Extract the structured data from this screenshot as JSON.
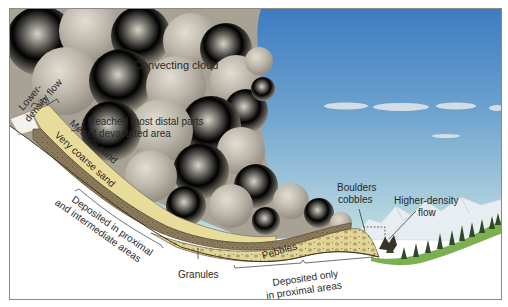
{
  "figure": {
    "colors": {
      "sky_top": "#3f7fc4",
      "sky_bottom": "#bcdde3",
      "cloud": "#b9b3a7",
      "medium_sand": "#e8dc9a",
      "very_coarse_sand": "#8a7a5a",
      "pebbles": "#e2d595",
      "vegetation": "#6aa04a",
      "mountains": "#e9eef2",
      "frame": "#8a8a8a"
    }
  },
  "labels": {
    "convecting_cloud": "Convecting cloud",
    "lower_density_flow_line1": "Lower-",
    "lower_density_flow_line2": "density flow",
    "reached_line1": "Reached most distal parts",
    "reached_line2": "of devastated area",
    "medium_sand": "Medium sand",
    "very_coarse_sand": "Very coarse sand",
    "deposited_proximal_intermediate_line1": "Deposited in proximal",
    "deposited_proximal_intermediate_line2": "and intermediate areas",
    "granules": "Granules",
    "pebbles": "Pebbles",
    "deposited_only_line1": "Deposited only",
    "deposited_only_line2": "in proximal areas",
    "boulders_line1": "Boulders",
    "boulders_line2": "cobbles",
    "higher_density_line1": "Higher-density",
    "higher_density_line2": "flow"
  }
}
